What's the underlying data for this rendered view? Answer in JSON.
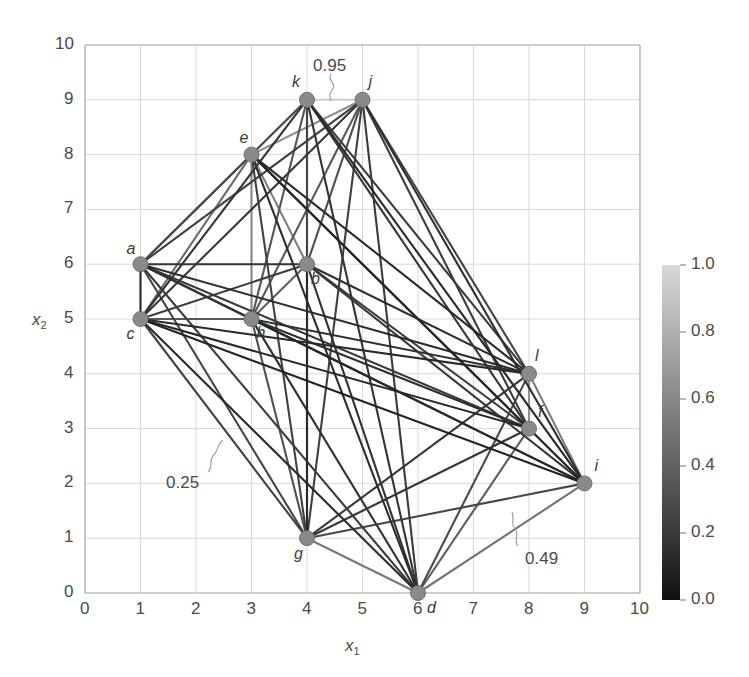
{
  "chart_data": {
    "type": "scatter",
    "title": "",
    "xlabel": "x1",
    "ylabel": "x2",
    "xlim": [
      0,
      10
    ],
    "ylim": [
      0,
      10
    ],
    "grid": true,
    "xticks": [
      "0",
      "1",
      "2",
      "3",
      "4",
      "5",
      "6",
      "7",
      "8",
      "9",
      "10"
    ],
    "yticks": [
      "0",
      "1",
      "2",
      "3",
      "4",
      "5",
      "6",
      "7",
      "8",
      "9",
      "10"
    ],
    "legend_position": "none",
    "nodes": [
      {
        "id": "a",
        "x": 1,
        "y": 6,
        "label": "a",
        "label_dx": -14,
        "label_dy": -24
      },
      {
        "id": "b",
        "x": 4,
        "y": 6,
        "label": "b",
        "label_dx": 4,
        "label_dy": 6
      },
      {
        "id": "c",
        "x": 1,
        "y": 5,
        "label": "c",
        "label_dx": -14,
        "label_dy": 6
      },
      {
        "id": "d",
        "x": 6,
        "y": 0,
        "label": "d",
        "label_dx": 9,
        "label_dy": 6
      },
      {
        "id": "e",
        "x": 3,
        "y": 8,
        "label": "e",
        "label_dx": -12,
        "label_dy": -26
      },
      {
        "id": "f",
        "x": 8,
        "y": 3,
        "label": "f",
        "label_dx": 9,
        "label_dy": -26
      },
      {
        "id": "g",
        "x": 4,
        "y": 1,
        "label": "g",
        "label_dx": -13,
        "label_dy": 7
      },
      {
        "id": "h",
        "x": 3,
        "y": 5,
        "label": "h",
        "label_dx": 5,
        "label_dy": 5
      },
      {
        "id": "i",
        "x": 9,
        "y": 2,
        "label": "i",
        "label_dx": 10,
        "label_dy": -26
      },
      {
        "id": "j",
        "x": 5,
        "y": 9,
        "label": "j",
        "label_dx": 6,
        "label_dy": -27
      },
      {
        "id": "k",
        "x": 4,
        "y": 9,
        "label": "k",
        "label_dx": -15,
        "label_dy": -27
      },
      {
        "id": "l",
        "x": 8,
        "y": 4,
        "label": "l",
        "label_dx": 6,
        "label_dy": -27
      }
    ],
    "edges": [
      {
        "s": "a",
        "t": "b",
        "w": 0.18
      },
      {
        "s": "a",
        "t": "c",
        "w": 0.1
      },
      {
        "s": "a",
        "t": "d",
        "w": 0.22
      },
      {
        "s": "a",
        "t": "e",
        "w": 0.33
      },
      {
        "s": "a",
        "t": "f",
        "w": 0.2
      },
      {
        "s": "a",
        "t": "g",
        "w": 0.26
      },
      {
        "s": "a",
        "t": "h",
        "w": 0.3
      },
      {
        "s": "a",
        "t": "i",
        "w": 0.16
      },
      {
        "s": "a",
        "t": "j",
        "w": 0.24
      },
      {
        "s": "a",
        "t": "k",
        "w": 0.28
      },
      {
        "s": "a",
        "t": "l",
        "w": 0.14
      },
      {
        "s": "b",
        "t": "c",
        "w": 0.21
      },
      {
        "s": "b",
        "t": "d",
        "w": 0.17
      },
      {
        "s": "b",
        "t": "e",
        "w": 0.55
      },
      {
        "s": "b",
        "t": "f",
        "w": 0.23
      },
      {
        "s": "b",
        "t": "g",
        "w": 0.12
      },
      {
        "s": "b",
        "t": "h",
        "w": 0.4
      },
      {
        "s": "b",
        "t": "i",
        "w": 0.19
      },
      {
        "s": "b",
        "t": "j",
        "w": 0.31
      },
      {
        "s": "b",
        "t": "k",
        "w": 0.27
      },
      {
        "s": "b",
        "t": "l",
        "w": 0.15
      },
      {
        "s": "c",
        "t": "d",
        "w": 0.13
      },
      {
        "s": "c",
        "t": "e",
        "w": 0.45
      },
      {
        "s": "c",
        "t": "f",
        "w": 0.11
      },
      {
        "s": "c",
        "t": "g",
        "w": 0.25
      },
      {
        "s": "c",
        "t": "h",
        "w": 0.35
      },
      {
        "s": "c",
        "t": "i",
        "w": 0.09
      },
      {
        "s": "c",
        "t": "j",
        "w": 0.2
      },
      {
        "s": "c",
        "t": "k",
        "w": 0.18
      },
      {
        "s": "c",
        "t": "l",
        "w": 0.12
      },
      {
        "s": "d",
        "t": "e",
        "w": 0.14
      },
      {
        "s": "d",
        "t": "f",
        "w": 0.38
      },
      {
        "s": "d",
        "t": "g",
        "w": 0.52
      },
      {
        "s": "d",
        "t": "h",
        "w": 0.16
      },
      {
        "s": "d",
        "t": "i",
        "w": 0.49
      },
      {
        "s": "d",
        "t": "j",
        "w": 0.21
      },
      {
        "s": "d",
        "t": "k",
        "w": 0.17
      },
      {
        "s": "d",
        "t": "l",
        "w": 0.29
      },
      {
        "s": "e",
        "t": "f",
        "w": 0.15
      },
      {
        "s": "e",
        "t": "g",
        "w": 0.24
      },
      {
        "s": "e",
        "t": "h",
        "w": 0.58
      },
      {
        "s": "e",
        "t": "i",
        "w": 0.1
      },
      {
        "s": "e",
        "t": "j",
        "w": 0.62
      },
      {
        "s": "e",
        "t": "k",
        "w": 0.66
      },
      {
        "s": "e",
        "t": "l",
        "w": 0.13
      },
      {
        "s": "f",
        "t": "g",
        "w": 0.18
      },
      {
        "s": "f",
        "t": "h",
        "w": 0.14
      },
      {
        "s": "f",
        "t": "i",
        "w": 0.6
      },
      {
        "s": "f",
        "t": "j",
        "w": 0.22
      },
      {
        "s": "f",
        "t": "k",
        "w": 0.19
      },
      {
        "s": "f",
        "t": "l",
        "w": 0.64
      },
      {
        "s": "g",
        "t": "h",
        "w": 0.32
      },
      {
        "s": "g",
        "t": "i",
        "w": 0.27
      },
      {
        "s": "g",
        "t": "j",
        "w": 0.23
      },
      {
        "s": "g",
        "t": "k",
        "w": 0.26
      },
      {
        "s": "g",
        "t": "l",
        "w": 0.2
      },
      {
        "s": "h",
        "t": "i",
        "w": 0.11
      },
      {
        "s": "h",
        "t": "j",
        "w": 0.36
      },
      {
        "s": "h",
        "t": "k",
        "w": 0.34
      },
      {
        "s": "h",
        "t": "l",
        "w": 0.15
      },
      {
        "s": "i",
        "t": "j",
        "w": 0.16
      },
      {
        "s": "i",
        "t": "k",
        "w": 0.13
      },
      {
        "s": "i",
        "t": "l",
        "w": 0.54
      },
      {
        "s": "j",
        "t": "k",
        "w": 0.95
      },
      {
        "s": "j",
        "t": "l",
        "w": 0.25
      },
      {
        "s": "k",
        "t": "l",
        "w": 0.21
      }
    ],
    "annotations": [
      {
        "text": "0.95",
        "x": 313,
        "y": 56,
        "leader": "M 331 74 C 326 80, 338 84, 332 90 C 327 96, 332 98, 330 101"
      },
      {
        "text": "0.25",
        "x": 166,
        "y": 473,
        "leader": "M 208 472 C 214 466, 208 462, 213 456 C 219 450, 217 444, 223 440"
      },
      {
        "text": "0.49",
        "x": 525,
        "y": 549,
        "leader": "M 518 546 C 513 540, 520 535, 515 529 C 510 523, 515 518, 512 512"
      }
    ],
    "colorbar": {
      "min": 0.0,
      "max": 1.0,
      "ticks": [
        "1.0",
        "0.8",
        "0.6",
        "0.4",
        "0.2",
        "0.0"
      ],
      "tick_values": [
        1.0,
        0.8,
        0.6,
        0.4,
        0.2,
        0.0
      ],
      "low_color": "#111111",
      "high_color": "#d8d8d8",
      "orientation": "vertical"
    },
    "style": {
      "node_color": "#8a8a8a",
      "node_edge_color": "#707070",
      "grid_color": "#d9d9d9",
      "axis_color": "#b0b0b0",
      "text_color": "#4a4a4a"
    }
  }
}
